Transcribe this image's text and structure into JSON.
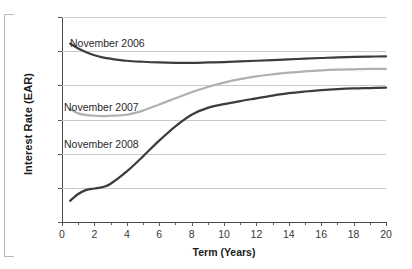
{
  "chart_data": {
    "type": "line",
    "title": "",
    "xlabel": "Term (Years)",
    "ylabel": "Interest Rate (EAR)",
    "xlim": [
      0,
      20
    ],
    "ylim": [
      0,
      6
    ],
    "grid": true,
    "legend_position": "inline-annotations",
    "x_ticks": [
      "0",
      "2",
      "4",
      "6",
      "8",
      "10",
      "12",
      "14",
      "16",
      "18",
      "20"
    ],
    "y_ticks": [
      "0%",
      "1%",
      "2%",
      "3%",
      "4%",
      "5%",
      "6%"
    ],
    "x": [
      0.5,
      1,
      1.5,
      2,
      2.5,
      3,
      4,
      5,
      6,
      7,
      8,
      9,
      10,
      11,
      12,
      13,
      14,
      15,
      16,
      17,
      18,
      19,
      20
    ],
    "series": [
      {
        "name": "November 2006",
        "color": "#3c3c3c",
        "values": [
          5.22,
          5.08,
          4.97,
          4.88,
          4.82,
          4.78,
          4.72,
          4.69,
          4.67,
          4.66,
          4.66,
          4.67,
          4.68,
          4.7,
          4.72,
          4.74,
          4.76,
          4.78,
          4.8,
          4.82,
          4.83,
          4.84,
          4.85
        ]
      },
      {
        "name": "November 2007",
        "color": "#b0b0b0",
        "values": [
          3.3,
          3.18,
          3.13,
          3.11,
          3.1,
          3.11,
          3.14,
          3.26,
          3.44,
          3.62,
          3.8,
          3.95,
          4.08,
          4.18,
          4.26,
          4.32,
          4.37,
          4.41,
          4.44,
          4.46,
          4.47,
          4.48,
          4.48
        ]
      },
      {
        "name": "November 2008",
        "color": "#3c3c3c",
        "values": [
          0.62,
          0.82,
          0.94,
          0.98,
          1.02,
          1.12,
          1.48,
          1.92,
          2.38,
          2.8,
          3.14,
          3.34,
          3.45,
          3.54,
          3.62,
          3.7,
          3.77,
          3.82,
          3.86,
          3.89,
          3.91,
          3.92,
          3.93
        ]
      }
    ],
    "annotations": [
      {
        "text": "November 2006",
        "x_px": 70,
        "y_px": 37
      },
      {
        "text": "November 2007",
        "x_px": 64,
        "y_px": 101
      },
      {
        "text": "November 2008",
        "x_px": 64,
        "y_px": 138
      }
    ]
  },
  "axes": {
    "y_title": "Interest Rate (EAR)",
    "x_title": "Term (Years)"
  }
}
